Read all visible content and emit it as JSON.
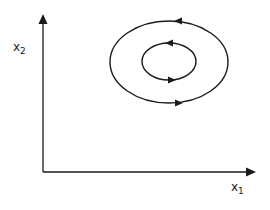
{
  "diagram": {
    "type": "phase-portrait",
    "axes": {
      "x_label": "x",
      "x_subscript": "1",
      "y_label": "x",
      "y_subscript": "2"
    },
    "orbits": [
      {
        "name": "outer-orbit",
        "direction": "counterclockwise"
      },
      {
        "name": "inner-orbit",
        "direction": "counterclockwise"
      }
    ],
    "colors": {
      "stroke": "#1a1a1a",
      "background": "#ffffff"
    }
  }
}
